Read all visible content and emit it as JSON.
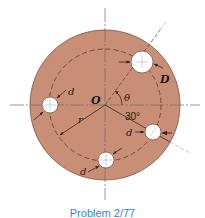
{
  "figure": {
    "colors": {
      "disk_fill": "#c98f76",
      "disk_edge": "#7a5040",
      "hole_fill": "#ffffff",
      "centerline": "#6b6b6b",
      "radial_line": "#9fb7d6",
      "dashed_circle": "#5a3a30",
      "arrow": "#3a2420",
      "caption": "#3a7fd0"
    },
    "labels": {
      "origin": "O",
      "theta": "θ",
      "angle": "30°",
      "radius": "r",
      "large_hole_diameter": "D",
      "small_hole_diameter_1": "d",
      "small_hole_diameter_2": "d",
      "small_hole_diameter_3": "d"
    },
    "holes": [
      {
        "name": "large-hole",
        "diameter_label": "D",
        "angle_label": "θ"
      },
      {
        "name": "left-hole",
        "diameter_label": "d",
        "angle_deg": 180
      },
      {
        "name": "bottom-hole",
        "diameter_label": "d",
        "angle_deg": 270
      },
      {
        "name": "right-hole",
        "diameter_label": "d",
        "angle_deg": -30
      }
    ]
  },
  "caption": {
    "text": "Problem 2/77"
  }
}
